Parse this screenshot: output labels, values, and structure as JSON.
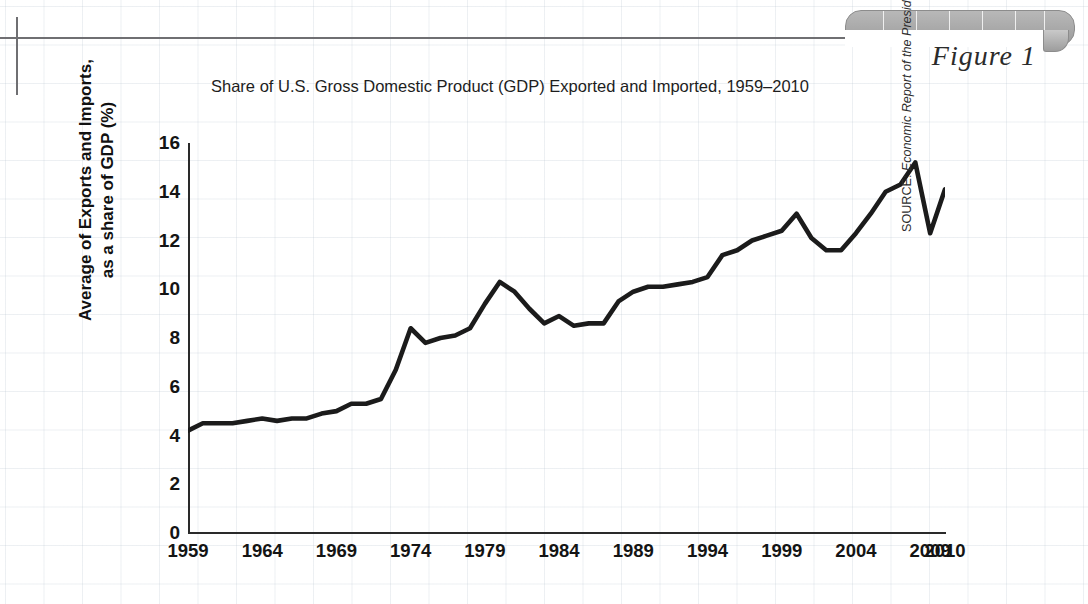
{
  "figure": {
    "label": "Figure 1",
    "title": "Share of U.S. Gross Domestic Product (GDP) Exported and Imported, 1959–2010"
  },
  "source": {
    "prefix": "SOURCE: ",
    "publication": "Economic Report of the President",
    "rest": " (Washington, D.C.: U.S. Government Printing Office, various years)."
  },
  "colors": {
    "line": "#1b1b1b",
    "axis": "#2a2a2a",
    "grid": "#c3cdd7",
    "tab": "#a8a8a8",
    "rule": "#6f6f72"
  },
  "chart_data": {
    "type": "line",
    "title": "Share of U.S. Gross Domestic Product (GDP) Exported and Imported, 1959–2010",
    "xlabel": "",
    "ylabel": "Average of Exports and Imports, as a share of GDP (%)",
    "ylabel_lines": [
      "Average of Exports and Imports,",
      "as a share of GDP (%)"
    ],
    "xlim": [
      1959,
      2010
    ],
    "ylim": [
      0,
      16
    ],
    "yticks": [
      0,
      2,
      4,
      6,
      8,
      10,
      12,
      14,
      16
    ],
    "xticks": [
      1959,
      1964,
      1969,
      1974,
      1979,
      1984,
      1989,
      1994,
      1999,
      2004,
      2009,
      2010
    ],
    "xtick_labels": [
      "1959",
      "1964",
      "1969",
      "1974",
      "1979",
      "1984",
      "1989",
      "1994",
      "1999",
      "2004",
      "2009",
      "2010"
    ],
    "grid": true,
    "legend": false,
    "series": [
      {
        "name": "Average of exports and imports as a share of GDP",
        "x": [
          1959,
          1960,
          1961,
          1962,
          1963,
          1964,
          1965,
          1966,
          1967,
          1968,
          1969,
          1970,
          1971,
          1972,
          1973,
          1974,
          1975,
          1976,
          1977,
          1978,
          1979,
          1980,
          1981,
          1982,
          1983,
          1984,
          1985,
          1986,
          1987,
          1988,
          1989,
          1990,
          1991,
          1992,
          1993,
          1994,
          1995,
          1996,
          1997,
          1998,
          1999,
          2000,
          2001,
          2002,
          2003,
          2004,
          2005,
          2006,
          2007,
          2008,
          2009,
          2010
        ],
        "values": [
          4.2,
          4.5,
          4.5,
          4.5,
          4.6,
          4.7,
          4.6,
          4.7,
          4.7,
          4.9,
          5.0,
          5.3,
          5.3,
          5.5,
          6.7,
          8.4,
          7.8,
          8.0,
          8.1,
          8.4,
          9.4,
          10.3,
          9.9,
          9.2,
          8.6,
          8.9,
          8.5,
          8.6,
          8.6,
          9.5,
          9.9,
          10.1,
          10.1,
          10.2,
          10.3,
          10.5,
          11.4,
          11.6,
          12.0,
          12.2,
          12.4,
          13.1,
          12.1,
          11.6,
          11.6,
          12.3,
          13.1,
          14.0,
          14.3,
          15.2,
          12.3,
          14.1
        ]
      }
    ]
  }
}
